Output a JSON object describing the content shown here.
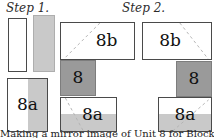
{
  "steps": {
    "step1_label": "Step 1.",
    "step2_label": "Step 2."
  },
  "step1": {
    "pieced_unit_label": "8a"
  },
  "step2": {
    "left_column": {
      "top_unit_label": "8b",
      "middle_unit_label": "8",
      "bottom_unit_label": "8a"
    },
    "right_column": {
      "top_unit_label": "8b",
      "middle_unit_label": "8",
      "bottom_unit_label": "8a"
    }
  },
  "caption": "Making a mirror image of Unit 8 for Block A",
  "colors": {
    "background": "#ffffff",
    "light_gray_fabric": "#c9c9c9",
    "dark_gray_fabric": "#9a9a9a",
    "seam_dash": "#b3b3b3",
    "outline": "#4a4a4a",
    "text": "#1a1a1a"
  }
}
